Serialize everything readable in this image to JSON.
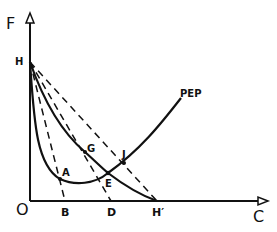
{
  "diagram": {
    "axes": {
      "y_label": "F",
      "x_label": "C",
      "origin_label": "O"
    },
    "points": {
      "H": {
        "label": "H",
        "x": 30,
        "y": 62
      },
      "B": {
        "label": "B",
        "x": 65,
        "y": 201
      },
      "D": {
        "label": "D",
        "x": 111,
        "y": 201
      },
      "H_prime": {
        "label": "H′",
        "x": 157,
        "y": 201
      },
      "A": {
        "label": "A",
        "x": 60,
        "y": 179
      },
      "G": {
        "label": "G",
        "x": 85,
        "y": 152
      },
      "E": {
        "label": "E",
        "x": 108,
        "y": 173
      },
      "J": {
        "label": "J",
        "x": 124,
        "y": 163
      }
    },
    "curves": {
      "pep_label": "PEP",
      "production_curve": "H-G-E-H′",
      "pep_curve": "H-A-E-J-PEP"
    },
    "dashed_lines": [
      "H-B",
      "H-D",
      "H-H′"
    ],
    "colors": {
      "stroke": "#111111",
      "background": "#ffffff"
    }
  }
}
